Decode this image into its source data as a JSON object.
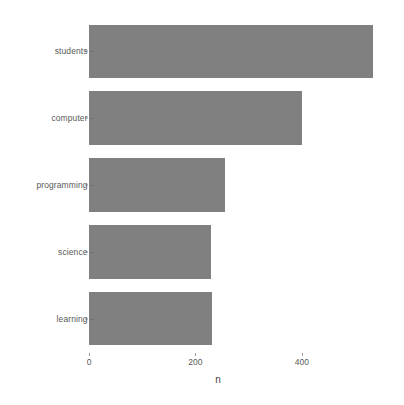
{
  "chart_data": {
    "type": "bar",
    "orientation": "horizontal",
    "title": "",
    "subtitle": "",
    "xlabel": "n",
    "ylabel": "",
    "categories": [
      "students",
      "computer",
      "programming",
      "science",
      "learning"
    ],
    "values": [
      533,
      400,
      255,
      229,
      231
    ],
    "series": [
      {
        "name": "n",
        "values": [
          533,
          400,
          255,
          229,
          231
        ]
      }
    ],
    "xlim": [
      0,
      543
    ],
    "x_ticks": [
      0,
      200,
      400
    ],
    "x_tick_labels": [
      "0",
      "200",
      "400"
    ],
    "y_tick_labels": [
      "students",
      "computer",
      "programming",
      "science",
      "learning"
    ],
    "grid": false,
    "legend": false,
    "legend_position": "none",
    "bar_color": "#808080",
    "panel_background": "#ffffff",
    "axis_text_color": "#5a5a5a",
    "axis_title_color": "#3f3f3f"
  }
}
